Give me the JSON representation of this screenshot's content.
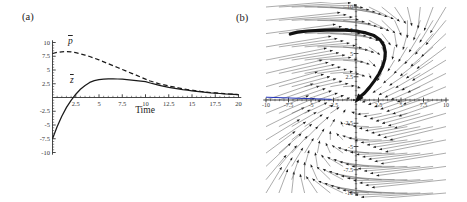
{
  "figure": {
    "panel_a_label": "(a)",
    "panel_b_label": "(b)"
  },
  "chart_data": [
    {
      "type": "line",
      "panel": "a",
      "title": "",
      "xlabel": "Time",
      "ylabel": "",
      "xlim": [
        0,
        20
      ],
      "ylim": [
        -10,
        10
      ],
      "grid": false,
      "axis_color": "#333333",
      "curve_color": "#1a1a1a",
      "x_ticks": [
        2.5,
        5,
        7.5,
        10,
        12.5,
        15,
        17.5,
        20
      ],
      "x_tick_labels": [
        "2.5",
        "5",
        "7.5",
        "10",
        "12.5",
        "15",
        "17.5",
        "20"
      ],
      "y_ticks": [
        10,
        7.5,
        5,
        2.5,
        -2.5,
        -5,
        -7.5,
        -10
      ],
      "y_tick_labels": [
        "10",
        "7.5",
        "5",
        "2.5",
        "-2.5",
        "-5",
        "-7.5",
        "-10"
      ],
      "minor_tick_step": 0.5,
      "t_start": 0,
      "t_step": 0.5,
      "series": [
        {
          "name": "pbar",
          "symbol": "p",
          "style": "dashed",
          "values": [
            8.0,
            8.2,
            8.3,
            8.35,
            8.3,
            8.15,
            7.95,
            7.7,
            7.45,
            7.15,
            6.85,
            6.5,
            6.15,
            5.8,
            5.45,
            5.1,
            4.75,
            4.4,
            4.05,
            3.7,
            3.35,
            3.0,
            2.75,
            2.5,
            2.3,
            2.1,
            1.93,
            1.76,
            1.6,
            1.46,
            1.33,
            1.21,
            1.1,
            1.0,
            0.91,
            0.83,
            0.75,
            0.69,
            0.63,
            0.58,
            0.53
          ]
        },
        {
          "name": "zbar",
          "symbol": "z",
          "style": "solid",
          "values": [
            -7.5,
            -5.3,
            -3.4,
            -1.8,
            -0.5,
            0.6,
            1.5,
            2.2,
            2.75,
            3.05,
            3.25,
            3.35,
            3.4,
            3.4,
            3.37,
            3.32,
            3.25,
            3.17,
            3.08,
            2.98,
            2.87,
            2.63,
            2.41,
            2.21,
            2.03,
            1.86,
            1.71,
            1.57,
            1.44,
            1.32,
            1.21,
            1.11,
            1.02,
            0.94,
            0.86,
            0.79,
            0.72,
            0.66,
            0.61,
            0.56,
            0.51
          ]
        }
      ]
    },
    {
      "type": "vector_field",
      "panel": "b",
      "title": "",
      "xlim": [
        -10,
        10
      ],
      "ylim": [
        -10,
        10
      ],
      "grid": false,
      "axis_color": "#333333",
      "x_ticks": [
        -10,
        -7.5,
        -5,
        -2.5,
        2.5,
        5,
        7.5,
        10
      ],
      "x_tick_labels": [
        "-10",
        "-7.5",
        "-5",
        "-2.5",
        "2.5",
        "5",
        "7.5",
        "10"
      ],
      "y_ticks": [
        10,
        7.5,
        5,
        2.5,
        -2.5,
        -5,
        -7.5,
        -10
      ],
      "y_tick_labels": [
        "10",
        "7.5",
        "5",
        "2.5",
        "-2.5",
        "-5",
        "-7.5",
        "-10"
      ],
      "minor_tick_step": 0.5,
      "field": {
        "matrix": [
          [
            -1.5,
            1.0
          ],
          [
            -0.5,
            -0.3
          ]
        ],
        "grid_n": 15,
        "range": [
          -10,
          10
        ],
        "scale": 0.35
      },
      "trajectory": [
        [
          -7.3,
          7.1
        ],
        [
          -6.5,
          7.3
        ],
        [
          -5.4,
          7.42
        ],
        [
          -4.0,
          7.5
        ],
        [
          -2.6,
          7.55
        ],
        [
          -1.2,
          7.52
        ],
        [
          0.0,
          7.42
        ],
        [
          1.1,
          7.22
        ],
        [
          2.0,
          6.92
        ],
        [
          2.7,
          6.45
        ],
        [
          3.1,
          5.85
        ],
        [
          3.25,
          5.15
        ],
        [
          3.2,
          4.4
        ],
        [
          2.95,
          3.6
        ],
        [
          2.55,
          2.8
        ],
        [
          2.05,
          2.05
        ],
        [
          1.5,
          1.35
        ],
        [
          0.95,
          0.75
        ],
        [
          0.45,
          0.35
        ],
        [
          0.18,
          0.05
        ]
      ],
      "blue_segment": [
        [
          -10,
          0.3
        ],
        [
          -2.7,
          0.07
        ]
      ],
      "colors": {
        "trajectory": "#111111",
        "field_line": "#666666",
        "field_head": "#1a1a1a",
        "blue": "#2233bb"
      }
    }
  ]
}
